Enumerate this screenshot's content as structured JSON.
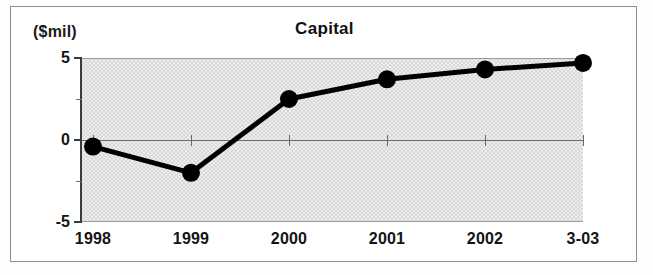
{
  "figure": {
    "unit_label": "($mil)",
    "title": "Capital"
  },
  "chart_data": {
    "type": "line",
    "title": "Capital",
    "subtitle": "",
    "xlabel": "",
    "ylabel": "($mil)",
    "unit": "$mil",
    "categories": [
      "1998",
      "1999",
      "2000",
      "2001",
      "2002",
      "3-03"
    ],
    "values": [
      -0.4,
      -2.0,
      2.5,
      3.7,
      4.3,
      4.7
    ],
    "series": [
      {
        "name": "Capital",
        "values": [
          -0.4,
          -2.0,
          2.5,
          3.7,
          4.3,
          4.7
        ]
      }
    ],
    "ylim": [
      -5,
      5
    ],
    "ytick_labels": [
      "5",
      "0",
      "-5"
    ],
    "ytick_values": [
      5,
      0,
      -5
    ],
    "yminor_tick_values": [
      2.5,
      -2.5
    ],
    "grid": false,
    "legend": "none",
    "marker": "filled-circle",
    "line_color": "#000000",
    "marker_color": "#000000",
    "plot_background": "#e6e6e6",
    "zero_line_value": 0
  }
}
